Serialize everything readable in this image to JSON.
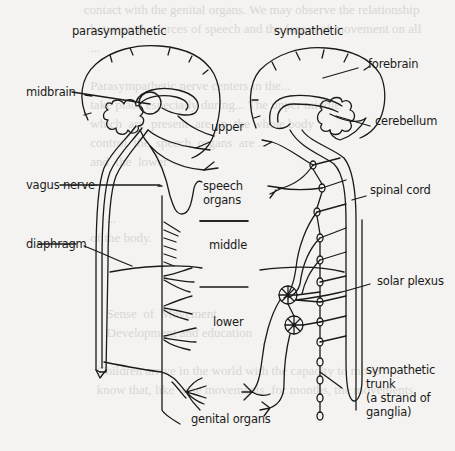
{
  "diagram": {
    "headings": {
      "left": "parasympathetic",
      "right": "sympathetic"
    },
    "labels": {
      "midbrain": "midbrain",
      "vagus_nerve": "vagus nerve",
      "diaphragm": "diaphragm",
      "upper": "upper",
      "speech_organs_1": "speech",
      "speech_organs_2": "organs",
      "middle": "middle",
      "lower": "lower",
      "genital_organs": "genital organs",
      "forebrain": "forebrain",
      "cerebellum": "cerebellum",
      "spinal_cord": "spinal cord",
      "solar_plexus": "solar plexus",
      "sympathetic_trunk_1": "sympathetic",
      "sympathetic_trunk_2": "trunk",
      "sympathetic_trunk_3": "(a strand of",
      "sympathetic_trunk_4": "ganglia)"
    },
    "colors": {
      "ink": "#1a1a1a",
      "paper": "#f4f3f1",
      "show_through": "#d9d6d2"
    }
  }
}
